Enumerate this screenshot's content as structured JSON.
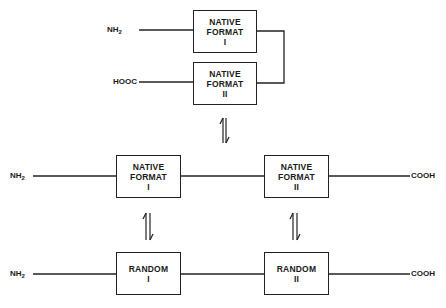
{
  "diagram": {
    "top": {
      "box1": {
        "line1": "NATIVE",
        "line2": "FORMAT",
        "line3": "I"
      },
      "box2": {
        "line1": "NATIVE",
        "line2": "FORMAT",
        "line3": "II"
      },
      "label_n": {
        "main": "NH",
        "sub": "2"
      },
      "label_c": "HOOC"
    },
    "middle": {
      "box1": {
        "line1": "NATIVE",
        "line2": "FORMAT",
        "line3": "I"
      },
      "box2": {
        "line1": "NATIVE",
        "line2": "FORMAT",
        "line3": "II"
      },
      "label_n": {
        "main": "NH",
        "sub": "2"
      },
      "label_c": "COOH"
    },
    "bottom": {
      "box1": {
        "line1": "RANDOM",
        "line2": "I"
      },
      "box2": {
        "line1": "RANDOM",
        "line2": "II"
      },
      "label_n": {
        "main": "NH",
        "sub": "2"
      },
      "label_c": "COOH"
    },
    "equilibrium_symbol": "⇌"
  }
}
